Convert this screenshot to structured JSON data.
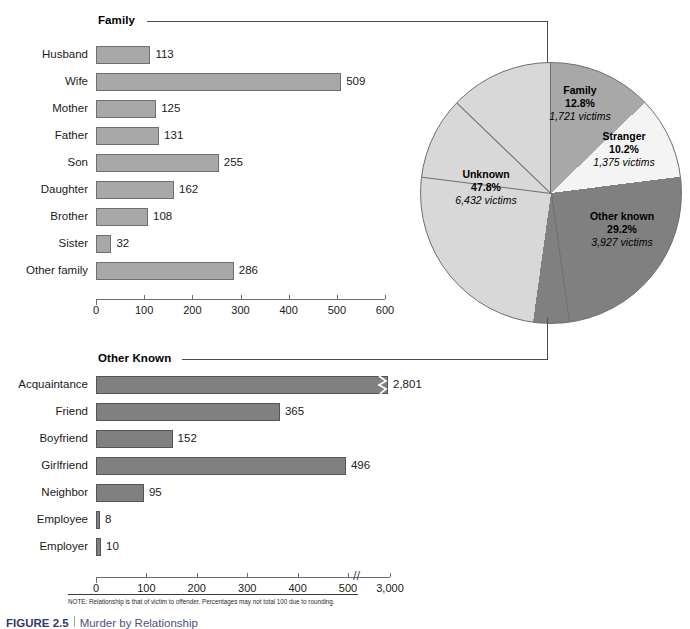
{
  "figure": {
    "note": "NOTE: Relationship is that of victim to offender. Percentages may not total 100 due to rounding.",
    "caption_number": "FIGURE 2.5",
    "caption_title": "Murder by Relationship"
  },
  "sections": {
    "family_label": "Family",
    "other_known_label": "Other Known"
  },
  "colors": {
    "bar_light": "#a8a8a8",
    "bar_dark": "#808080",
    "pie_unknown": "#d8d8d8",
    "pie_family": "#a8a8a8",
    "pie_stranger": "#f4f4f4",
    "pie_other_known": "#808080",
    "outline": "#6e6e6e",
    "rule": "#4b4b52",
    "caption_accent": "#2f3a6b"
  },
  "chart_data": [
    {
      "type": "bar",
      "id": "family",
      "title": "Family",
      "orientation": "horizontal",
      "categories": [
        "Husband",
        "Wife",
        "Mother",
        "Father",
        "Son",
        "Daughter",
        "Brother",
        "Sister",
        "Other family"
      ],
      "values": [
        113,
        509,
        125,
        131,
        255,
        162,
        108,
        32,
        286
      ],
      "value_labels": [
        "113",
        "509",
        "125",
        "131",
        "255",
        "162",
        "108",
        "32",
        "286"
      ],
      "xlabel": "",
      "ylabel": "",
      "xlim": [
        0,
        600
      ],
      "xticks": [
        0,
        100,
        200,
        300,
        400,
        500,
        600
      ],
      "xtick_labels": [
        "0",
        "100",
        "200",
        "300",
        "400",
        "500",
        "600"
      ],
      "grid": false,
      "axis_break": false
    },
    {
      "type": "pie",
      "id": "relationship-shares",
      "title": "",
      "labels": [
        "Family",
        "Stranger",
        "Other known",
        "Unknown"
      ],
      "percents": [
        12.8,
        10.2,
        29.2,
        47.8
      ],
      "values": [
        1721,
        1375,
        3927,
        6432
      ],
      "percent_labels": [
        "12.8%",
        "10.2%",
        "29.2%",
        "47.8%"
      ],
      "value_labels": [
        "1,721 victims",
        "1,375 victims",
        "3,927 victims",
        "6,432 victims"
      ],
      "slice_colors": [
        "#a8a8a8",
        "#f4f4f4",
        "#808080",
        "#d8d8d8"
      ],
      "legend": "none"
    },
    {
      "type": "bar",
      "id": "other-known",
      "title": "Other Known",
      "orientation": "horizontal",
      "categories": [
        "Acquaintance",
        "Friend",
        "Boyfriend",
        "Girlfriend",
        "Neighbor",
        "Employee",
        "Employer"
      ],
      "values": [
        2801,
        365,
        152,
        496,
        95,
        8,
        10
      ],
      "value_labels": [
        "2,801",
        "365",
        "152",
        "496",
        "95",
        "8",
        "10"
      ],
      "xlabel": "",
      "ylabel": "",
      "xlim": [
        0,
        3000
      ],
      "xticks": [
        0,
        100,
        200,
        300,
        400,
        500,
        3000
      ],
      "xtick_labels": [
        "0",
        "100",
        "200",
        "300",
        "400",
        "500",
        "3,000"
      ],
      "grid": false,
      "axis_break": true,
      "axis_break_symbol": "//"
    }
  ],
  "pie_slices": [
    {
      "label": "Family",
      "percent": "12.8%",
      "victims": "1,721 victims"
    },
    {
      "label": "Stranger",
      "percent": "10.2%",
      "victims": "1,375 victims"
    },
    {
      "label": "Other known",
      "percent": "29.2%",
      "victims": "3,927 victims"
    },
    {
      "label": "Unknown",
      "percent": "47.8%",
      "victims": "6,432 victims"
    }
  ]
}
